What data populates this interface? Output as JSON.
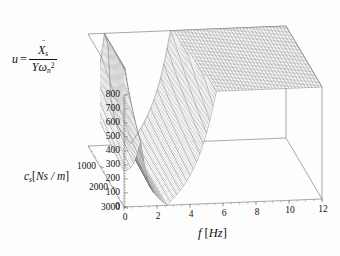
{
  "figure": {
    "type": "3d-surface-plot",
    "background_color": "#fdfdfd",
    "mesh_color": "#4a4a4a",
    "axis_color": "#6e6e6e"
  },
  "labels": {
    "z_axis": {
      "lhs": "u",
      "equals": "=",
      "numerator_base": "X",
      "numerator_dots": "¨",
      "numerator_sub": "s",
      "denominator_Y": "Y",
      "denominator_omega": "ω",
      "denominator_sub": "n",
      "denominator_sup": "2",
      "plain": "u = Ẍs / (Y ωn²)"
    },
    "y_axis": {
      "symbol": "c",
      "symbol_sub": "s",
      "unit_open": "[",
      "unit": "Ns / m",
      "unit_close": "]",
      "plain": "cs [Ns/m]"
    },
    "x_axis": {
      "symbol": "f",
      "unit_open": "[",
      "unit": "Hz",
      "unit_close": "]",
      "plain": "f [Hz]"
    }
  },
  "ticks": {
    "z": [
      "800",
      "700",
      "600",
      "500",
      "400",
      "300",
      "200",
      "100",
      "0"
    ],
    "z_values": [
      800,
      700,
      600,
      500,
      400,
      300,
      200,
      100,
      0
    ],
    "y": [
      "1000",
      "2000",
      "3000"
    ],
    "y_values": [
      1000,
      2000,
      3000
    ],
    "x": [
      "0",
      "2",
      "4",
      "6",
      "8",
      "10",
      "12"
    ],
    "x_values": [
      0,
      2,
      4,
      6,
      8,
      10,
      12
    ]
  },
  "chart_data": {
    "type": "surface",
    "title": "",
    "xlabel": "f [Hz]",
    "ylabel": "cs [Ns/m]",
    "zlabel": "u = Xs̈ / (Y ωn²)",
    "xlim": [
      0,
      12
    ],
    "ylim": [
      0,
      3000
    ],
    "zlim": [
      0,
      800
    ],
    "grid": false,
    "legend": null,
    "x_tick_step": 2,
    "y_tick_step": 1000,
    "z_tick_step": 100,
    "resonances": [
      {
        "name": "first mode",
        "f_Hz": 1.05,
        "peak_u_at_cs0": 800,
        "clipped": true
      },
      {
        "name": "second mode",
        "f_Hz": 6.85,
        "peak_u_at_cs0": 800,
        "clipped": true
      }
    ],
    "antiresonance": {
      "f_Hz": 2.6,
      "u_min_at_cs0": 2
    },
    "surface_model": {
      "f_samples": 61,
      "cs_samples": 45,
      "f_range": [
        0,
        12
      ],
      "cs_range": [
        0,
        3000
      ],
      "peak1_f": 1.05,
      "peak2_f": 6.85,
      "damping_scale": 900,
      "clip_z": 800
    },
    "sample_profiles": [
      {
        "cs": 0,
        "f": [
          0,
          0.5,
          1.05,
          1.6,
          2.6,
          4,
          5.5,
          6.85,
          8,
          9.5,
          11,
          12
        ],
        "u": [
          40,
          230,
          800,
          300,
          2,
          60,
          330,
          800,
          250,
          150,
          210,
          300
        ]
      },
      {
        "cs": 1000,
        "f": [
          0,
          0.5,
          1.05,
          1.6,
          2.6,
          4,
          5.5,
          6.85,
          8,
          9.5,
          11,
          12
        ],
        "u": [
          38,
          120,
          210,
          150,
          20,
          70,
          180,
          260,
          160,
          120,
          170,
          240
        ]
      },
      {
        "cs": 2000,
        "f": [
          0,
          0.5,
          1.05,
          1.6,
          2.6,
          4,
          5.5,
          6.85,
          8,
          9.5,
          11,
          12
        ],
        "u": [
          36,
          85,
          120,
          100,
          35,
          75,
          125,
          150,
          120,
          105,
          145,
          200
        ]
      },
      {
        "cs": 3000,
        "f": [
          0,
          0.5,
          1.05,
          1.6,
          2.6,
          4,
          5.5,
          6.85,
          8,
          9.5,
          11,
          12
        ],
        "u": [
          34,
          70,
          90,
          80,
          42,
          76,
          100,
          115,
          100,
          95,
          130,
          175
        ]
      }
    ]
  },
  "geometry": {
    "origin_px": [
      124,
      207
    ],
    "x_axis_end_px": [
      322,
      199
    ],
    "y_axis_end_px": [
      88,
      146
    ],
    "z_axis_top_px": [
      100,
      26
    ],
    "z_axis_bottom_px": [
      100,
      138
    ]
  }
}
